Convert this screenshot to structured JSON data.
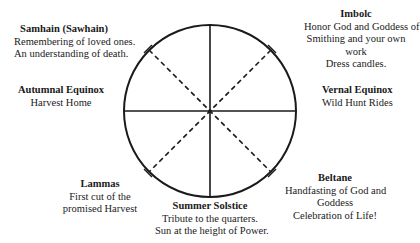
{
  "diagram": {
    "type": "wheel-of-the-year",
    "circle": {
      "cx": 210,
      "cy": 111,
      "r": 86,
      "stroke": "#1a1a1a"
    },
    "spokes": {
      "solid": [
        "vertical",
        "horizontal"
      ],
      "dashed": [
        "diagonal-ne-sw",
        "diagonal-nw-se"
      ]
    }
  },
  "sabbats": {
    "samhain": {
      "title": "Samhain (Sawhain)",
      "lines": [
        "Remembering of loved ones.",
        "An understanding of death."
      ]
    },
    "imbolc": {
      "title": "Imbolc",
      "lines": [
        "Honor God and Goddess of",
        "Smithing and your own",
        "work",
        "Dress candles."
      ]
    },
    "autumnal_equinox": {
      "title": "Autumnal Equinox",
      "lines": [
        "Harvest Home"
      ]
    },
    "vernal_equinox": {
      "title": "Vernal Equinox",
      "lines": [
        "Wild Hunt Rides"
      ]
    },
    "lammas": {
      "title": "Lammas",
      "lines": [
        "First cut of the",
        "promised Harvest"
      ]
    },
    "summer_solstice": {
      "title": "Summer Solstice",
      "lines": [
        "Tribute to the quarters.",
        "Sun at the height of Power."
      ]
    },
    "beltane": {
      "title": "Beltane",
      "lines": [
        "Handfasting of God and",
        "Goddess",
        "Celebration of Life!"
      ]
    }
  }
}
